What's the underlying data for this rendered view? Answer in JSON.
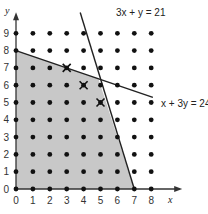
{
  "chart_data": {
    "type": "scatter",
    "title": "",
    "xlabel": "x",
    "ylabel": "y",
    "xlim": [
      0,
      8
    ],
    "ylim": [
      0,
      9
    ],
    "x_ticks": [
      0,
      1,
      2,
      3,
      4,
      5,
      6,
      7,
      8
    ],
    "y_ticks": [
      0,
      1,
      2,
      3,
      4,
      5,
      6,
      7,
      8,
      9
    ],
    "grid": false,
    "lattice_points": "all integer points (x,y) with 0<=x<=8, 0<=y<=9",
    "constraints": [
      {
        "label": "3x + y = 21",
        "points": [
          [
            3.8,
            10.2
          ],
          [
            7,
            0
          ]
        ]
      },
      {
        "label": "x + 3y = 24",
        "points": [
          [
            0,
            8
          ],
          [
            8.1,
            5.3
          ]
        ]
      }
    ],
    "feasible_region": {
      "fill": "#c8c8c8",
      "vertices": [
        [
          0,
          0
        ],
        [
          0,
          8
        ],
        [
          4.875,
          6.375
        ],
        [
          7,
          0
        ]
      ]
    },
    "marked_points": [
      [
        3,
        7
      ],
      [
        4,
        6
      ],
      [
        5,
        5
      ]
    ],
    "annotations": [
      "3x + y = 21",
      "x + 3y = 24"
    ]
  },
  "labels": {
    "x_axis": "x",
    "y_axis": "y",
    "line1": "3x + y = 21",
    "line2": "x + 3y = 24"
  }
}
